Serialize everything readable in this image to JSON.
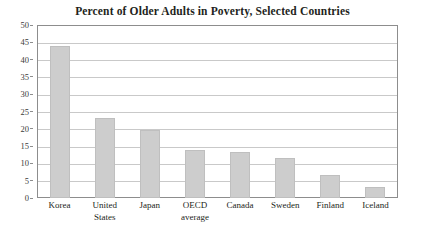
{
  "chart_data": {
    "type": "bar",
    "title": "Percent of Older Adults in Poverty, Selected Countries",
    "xlabel": "",
    "ylabel": "",
    "ylim": [
      0,
      50
    ],
    "ytick_step": 5,
    "yticks": [
      "0",
      "5",
      "10",
      "15",
      "20",
      "25",
      "30",
      "35",
      "40",
      "45",
      "50"
    ],
    "grid": true,
    "legend": false,
    "legend_position": "none",
    "categories": [
      "Korea",
      "United\nStates",
      "Japan",
      "OECD\naverage",
      "Canada",
      "Sweden",
      "Finland",
      "Iceland"
    ],
    "values": [
      44.0,
      23.1,
      19.7,
      13.9,
      13.3,
      11.6,
      6.6,
      3.2
    ],
    "bar_color": "#cdcdcd",
    "bar_edge_color": "#bfbfbf",
    "frame_color": "#8d8d8d",
    "gridline_color": "#c9c9c9",
    "text_color": "#231f20"
  }
}
